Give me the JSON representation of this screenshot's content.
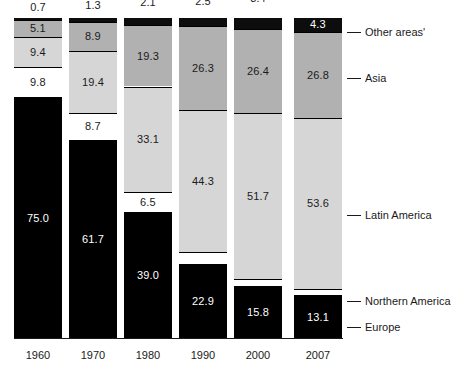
{
  "chart_data": {
    "type": "bar",
    "subtype": "stacked-100-percent",
    "title": "",
    "xlabel": "",
    "ylabel": "",
    "ylim": [
      0,
      100
    ],
    "grid": false,
    "legend_position": "right",
    "categories": [
      "1960",
      "1970",
      "1980",
      "1990",
      "2000",
      "2007"
    ],
    "series": [
      {
        "name": "Europe",
        "values": [
          75.0,
          61.7,
          39.0,
          22.9,
          15.8,
          13.1
        ]
      },
      {
        "name": "Northern America",
        "values": [
          9.8,
          8.7,
          6.5,
          4.0,
          2.7,
          2.2
        ]
      },
      {
        "name": "Latin America",
        "values": [
          9.4,
          19.4,
          33.1,
          44.3,
          51.7,
          53.6
        ]
      },
      {
        "name": "Asia",
        "values": [
          5.1,
          8.9,
          19.3,
          26.3,
          26.4,
          26.8
        ]
      },
      {
        "name": "Other areas'",
        "values": [
          0.7,
          1.3,
          2.1,
          2.5,
          3.4,
          4.3
        ]
      }
    ]
  },
  "legend": {
    "items": [
      {
        "label": "Other areas'"
      },
      {
        "label": "Asia"
      },
      {
        "label": "Latin America"
      },
      {
        "label": "Northern America"
      },
      {
        "label": "Europe"
      }
    ]
  },
  "colors": {
    "europe": "#000000",
    "northern_america": "#ffffff",
    "latin_america": "#d6d6d6",
    "asia": "#b1b1b1",
    "other_areas": "#0d0d0d",
    "text": "#1a1a1a",
    "axis": "#1a1a1a",
    "background": "#ffffff"
  },
  "axis": {
    "categories": [
      "1960",
      "1970",
      "1980",
      "1990",
      "2000",
      "2007"
    ]
  }
}
